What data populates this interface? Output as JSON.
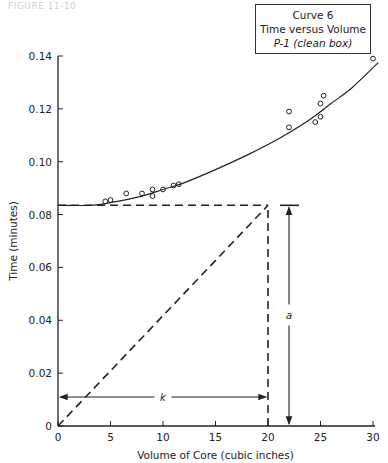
{
  "header": {
    "faint_text": "FIGURE 11-10"
  },
  "legend": {
    "line1": "Curve 6",
    "line2": "Time versus Volume",
    "line3": "P-1 (clean box)"
  },
  "annotations": {
    "k_label": "k",
    "a_label": "a"
  },
  "chart_data": {
    "type": "scatter",
    "xlabel": "Volume of Core (cubic inches)",
    "ylabel": "Time (minutes)",
    "xlim": [
      0,
      30
    ],
    "ylim": [
      0,
      0.14
    ],
    "x_ticks": [
      "0",
      "5",
      "10",
      "15",
      "20",
      "25",
      "30"
    ],
    "y_ticks": [
      "0",
      "0.02",
      "0.04",
      "0.06",
      "0.08",
      "0.10",
      "0.12",
      "0.14"
    ],
    "grid": false,
    "legend_position": "top-right",
    "series": [
      {
        "name": "Observed points",
        "marker": "open-circle",
        "x": [
          4.5,
          5.0,
          6.5,
          8.0,
          9.0,
          9.0,
          10.0,
          11.0,
          11.5,
          22.0,
          22.0,
          24.5,
          25.0,
          25.0,
          25.3,
          30.0
        ],
        "y": [
          0.085,
          0.0855,
          0.088,
          0.088,
          0.0895,
          0.087,
          0.0895,
          0.091,
          0.0915,
          0.119,
          0.113,
          0.115,
          0.122,
          0.117,
          0.125,
          0.139
        ]
      },
      {
        "name": "Fitted curve",
        "style": "solid",
        "x": [
          0,
          3,
          5,
          8,
          10,
          12,
          15,
          18,
          20,
          22,
          24,
          26,
          28,
          30.5
        ],
        "y": [
          0.0835,
          0.0835,
          0.0845,
          0.087,
          0.0895,
          0.092,
          0.097,
          0.1025,
          0.1065,
          0.111,
          0.116,
          0.122,
          0.128,
          0.1375
        ]
      },
      {
        "name": "Intercept line a = 0.0835",
        "style": "dashed",
        "x": [
          0,
          20
        ],
        "y": [
          0.0835,
          0.0835
        ]
      },
      {
        "name": "Diagonal construction line",
        "style": "dashed",
        "x": [
          0,
          20
        ],
        "y": [
          0,
          0.0835
        ]
      },
      {
        "name": "Vertical construction line x = 20",
        "style": "dashed",
        "x": [
          20,
          20
        ],
        "y": [
          0,
          0.0835
        ]
      }
    ],
    "annotations": [
      {
        "text": "k",
        "type": "double-arrow",
        "from": [
          0,
          0.011
        ],
        "to": [
          20,
          0.011
        ]
      },
      {
        "text": "a",
        "type": "double-arrow",
        "from": [
          22,
          0
        ],
        "to": [
          22,
          0.0835
        ]
      }
    ]
  }
}
